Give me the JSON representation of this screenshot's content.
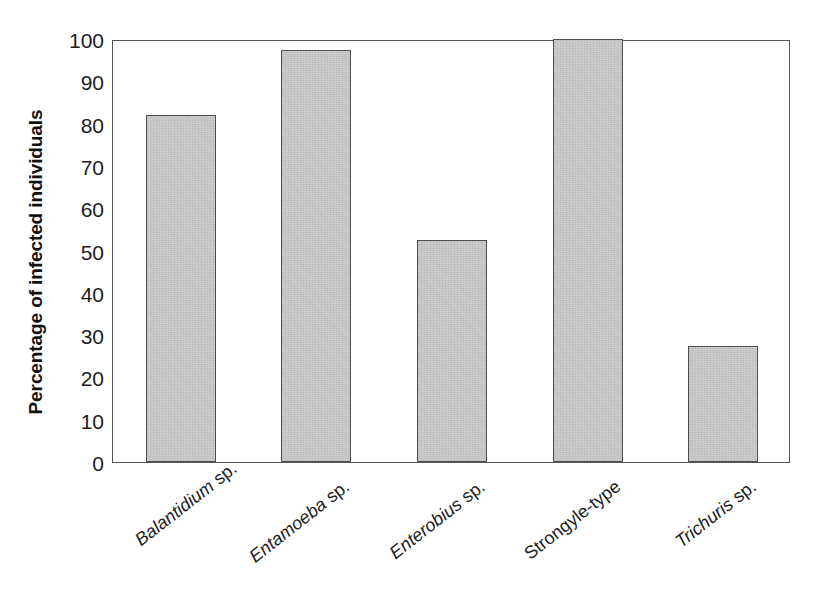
{
  "chart_data": {
    "type": "bar",
    "title": "",
    "subtitle": "",
    "xlabel": "",
    "ylabel": "Percentage of infected individuals",
    "categories": [
      "Balantidium sp.",
      "Entamoeba sp.",
      "Enterobius sp.",
      "Strongyle-type",
      "Trichuris sp."
    ],
    "values": [
      82,
      97.5,
      52.5,
      100,
      27.5
    ],
    "ylim": [
      0,
      100
    ],
    "y_ticks": [
      0,
      10,
      20,
      30,
      40,
      50,
      60,
      70,
      80,
      90,
      100
    ],
    "y_tick_labels": [
      "0",
      "10",
      "20",
      "30",
      "40",
      "50",
      "60",
      "70",
      "80",
      "90",
      "100"
    ],
    "grid": false,
    "legend": false,
    "legend_position": "none",
    "bar_fill_color": "#c9c9c9",
    "bar_edge_color": "#4f4f4f",
    "axis_color": "#555555",
    "background_color": "#ffffff"
  },
  "axes": {
    "y_title": "Percentage of infected individuals",
    "y_tick_labels": [
      "100",
      "90",
      "80",
      "70",
      "60",
      "50",
      "40",
      "30",
      "20",
      "10",
      "0"
    ]
  },
  "x_categories": [
    {
      "genus": "Balantidium",
      "suffix": " sp.",
      "italic": true,
      "full": "Balantidium sp."
    },
    {
      "genus": "Entamoeba",
      "suffix": " sp.",
      "italic": true,
      "full": "Entamoeba sp."
    },
    {
      "genus": "Enterobius",
      "suffix": " sp.",
      "italic": true,
      "full": "Enterobius sp."
    },
    {
      "genus": "Strongyle-type",
      "suffix": "",
      "italic": false,
      "full": "Strongyle-type"
    },
    {
      "genus": "Trichuris",
      "suffix": " sp.",
      "italic": true,
      "full": "Trichuris sp."
    }
  ]
}
